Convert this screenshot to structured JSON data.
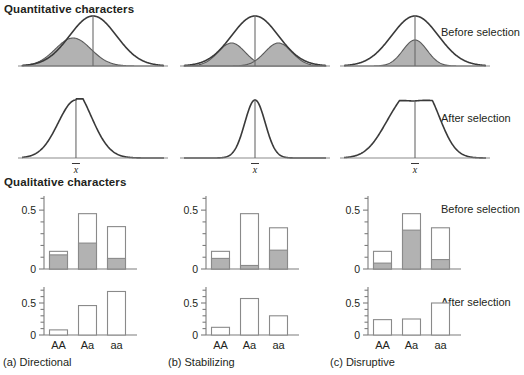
{
  "figure": {
    "section_titles": {
      "quantitative": "Quantitative characters",
      "qualitative": "Qualitative characters"
    },
    "row_labels": {
      "before": "Before selection",
      "after": "After selection"
    },
    "mean_symbol": "x",
    "captions": {
      "a": "(a)  Directional",
      "b": "(b)  Stabilizing",
      "c": "(c)  Disruptive"
    },
    "colors": {
      "shade_gray": "#b2b2b2",
      "curve_stroke": "#3a3a3a",
      "axis": "#7d7d7d",
      "text": "#231f20",
      "background": "#ffffff"
    }
  },
  "chart_data": [
    {
      "type": "line",
      "title": "Directional - Before selection",
      "panel": "a",
      "row": "before",
      "xlabel": "",
      "ylabel": "Frequency",
      "description": "Normal distribution with shaded sub-distribution shifted left of the mean",
      "curve": {
        "mean": 0.5,
        "sd": 0.165,
        "peak": 1.0
      },
      "shaded": {
        "mean": 0.36,
        "sd": 0.125,
        "peak": 0.56
      },
      "mean_marker": 0.5
    },
    {
      "type": "line",
      "title": "Stabilizing - Before selection",
      "panel": "b",
      "row": "before",
      "xlabel": "",
      "ylabel": "Frequency",
      "description": "Normal distribution with two shaded sub-distributions flanking the mean",
      "curve": {
        "mean": 0.5,
        "sd": 0.165,
        "peak": 1.0
      },
      "shaded": [
        {
          "mean": 0.335,
          "sd": 0.095,
          "peak": 0.46
        },
        {
          "mean": 0.665,
          "sd": 0.095,
          "peak": 0.46
        }
      ],
      "mean_marker": 0.5
    },
    {
      "type": "line",
      "title": "Disruptive - Before selection",
      "panel": "c",
      "row": "before",
      "xlabel": "",
      "ylabel": "Frequency",
      "description": "Normal distribution with a narrow shaded sub-distribution centered on the mean",
      "curve": {
        "mean": 0.5,
        "sd": 0.165,
        "peak": 1.0
      },
      "shaded": {
        "mean": 0.5,
        "sd": 0.085,
        "peak": 0.52
      },
      "mean_marker": 0.5
    },
    {
      "type": "line",
      "title": "Directional - After selection",
      "panel": "a",
      "row": "after",
      "xlabel": "",
      "ylabel": "Frequency",
      "description": "Distribution shifted toward lower values, right-skewed tail",
      "curve": {
        "mean": 0.38,
        "sd": 0.125,
        "peak": 1.0,
        "skew": 0.5
      },
      "mean_marker": 0.38
    },
    {
      "type": "line",
      "title": "Stabilizing - After selection",
      "panel": "b",
      "row": "after",
      "xlabel": "",
      "ylabel": "Frequency",
      "description": "Narrow tall distribution centered on the mean, reduced variance",
      "curve": {
        "mean": 0.5,
        "sd": 0.072,
        "peak": 1.0
      },
      "mean_marker": 0.5
    },
    {
      "type": "line",
      "title": "Disruptive - After selection",
      "panel": "c",
      "row": "after",
      "xlabel": "",
      "ylabel": "Frequency",
      "description": "Broad bimodal distribution with two peaks flanking the mean",
      "curve": {
        "modes": [
          {
            "mean": 0.4,
            "sd": 0.13,
            "peak": 0.8
          },
          {
            "mean": 0.58,
            "sd": 0.11,
            "peak": 0.88
          }
        ]
      },
      "mean_marker": 0.5
    },
    {
      "type": "bar",
      "title": "Directional - Before selection (genotype frequencies)",
      "panel": "a",
      "row": "before",
      "stacked": true,
      "categories": [
        "AA",
        "Aa",
        "aa"
      ],
      "series": [
        {
          "name": "selected (shaded)",
          "values": [
            0.12,
            0.22,
            0.09
          ]
        },
        {
          "name": "total",
          "values": [
            0.15,
            0.47,
            0.36
          ]
        }
      ],
      "ylim": [
        0,
        0.62
      ],
      "yticks": [
        0,
        0.5
      ],
      "ytick_labels": [
        "0",
        "0.5"
      ],
      "minor_tick_step": 0.1
    },
    {
      "type": "bar",
      "title": "Stabilizing - Before selection (genotype frequencies)",
      "panel": "b",
      "row": "before",
      "stacked": true,
      "categories": [
        "AA",
        "Aa",
        "aa"
      ],
      "series": [
        {
          "name": "selected (shaded)",
          "values": [
            0.09,
            0.03,
            0.16
          ]
        },
        {
          "name": "total",
          "values": [
            0.15,
            0.47,
            0.35
          ]
        }
      ],
      "ylim": [
        0,
        0.62
      ],
      "yticks": [
        0,
        0.5
      ],
      "ytick_labels": [
        "0",
        "0.5"
      ],
      "minor_tick_step": 0.1
    },
    {
      "type": "bar",
      "title": "Disruptive - Before selection (genotype frequencies)",
      "panel": "c",
      "row": "before",
      "stacked": true,
      "categories": [
        "AA",
        "Aa",
        "aa"
      ],
      "series": [
        {
          "name": "selected (shaded)",
          "values": [
            0.05,
            0.33,
            0.08
          ]
        },
        {
          "name": "total",
          "values": [
            0.15,
            0.47,
            0.35
          ]
        }
      ],
      "ylim": [
        0,
        0.62
      ],
      "yticks": [
        0,
        0.5
      ],
      "ytick_labels": [
        "0",
        "0.5"
      ],
      "minor_tick_step": 0.1
    },
    {
      "type": "bar",
      "title": "Directional - After selection (genotype frequencies)",
      "panel": "a",
      "row": "after",
      "stacked": false,
      "categories": [
        "AA",
        "Aa",
        "aa"
      ],
      "series": [
        {
          "name": "frequency",
          "values": [
            0.08,
            0.46,
            0.68
          ]
        }
      ],
      "ylim": [
        0,
        0.75
      ],
      "yticks": [
        0,
        0.5
      ],
      "ytick_labels": [
        "0",
        "0.5"
      ],
      "minor_tick_step": 0.1
    },
    {
      "type": "bar",
      "title": "Stabilizing - After selection (genotype frequencies)",
      "panel": "b",
      "row": "after",
      "stacked": false,
      "categories": [
        "AA",
        "Aa",
        "aa"
      ],
      "series": [
        {
          "name": "frequency",
          "values": [
            0.12,
            0.57,
            0.3
          ]
        }
      ],
      "ylim": [
        0,
        0.75
      ],
      "yticks": [
        0,
        0.5
      ],
      "ytick_labels": [
        "0",
        "0.5"
      ],
      "minor_tick_step": 0.1
    },
    {
      "type": "bar",
      "title": "Disruptive - After selection (genotype frequencies)",
      "panel": "c",
      "row": "after",
      "stacked": false,
      "categories": [
        "AA",
        "Aa",
        "aa"
      ],
      "series": [
        {
          "name": "frequency",
          "values": [
            0.24,
            0.25,
            0.5
          ]
        }
      ],
      "ylim": [
        0,
        0.75
      ],
      "yticks": [
        0,
        0.5
      ],
      "ytick_labels": [
        "0",
        "0.5"
      ],
      "minor_tick_step": 0.1
    }
  ]
}
